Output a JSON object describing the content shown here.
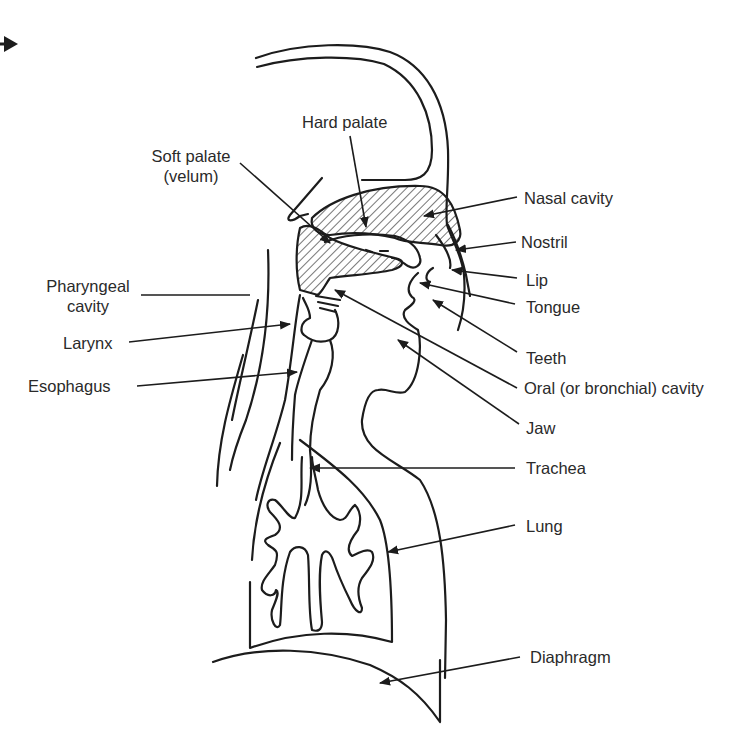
{
  "diagram": {
    "type": "anatomy",
    "colors": {
      "line": "#1c1c1c",
      "text": "#2a2a2a",
      "background": "#ffffff"
    },
    "labels": {
      "hard_palate": "Hard palate",
      "soft_palate_line1": "Soft palate",
      "soft_palate_line2": "(velum)",
      "nasal_cavity": "Nasal cavity",
      "nostril": "Nostril",
      "lip": "Lip",
      "tongue": "Tongue",
      "teeth": "Teeth",
      "oral_cavity": "Oral (or bronchial) cavity",
      "jaw": "Jaw",
      "trachea": "Trachea",
      "lung": "Lung",
      "diaphragm": "Diaphragm",
      "pharyngeal_line1": "Pharyngeal",
      "pharyngeal_line2": "cavity",
      "larynx": "Larynx",
      "esophagus": "Esophagus"
    },
    "corner_arrow": "right-pointing-arrow"
  }
}
